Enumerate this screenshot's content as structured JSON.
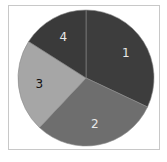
{
  "chart_data": {
    "type": "pie",
    "title": "",
    "categories": [
      "1",
      "2",
      "3",
      "4"
    ],
    "values": [
      32,
      30,
      22,
      16
    ],
    "colors": [
      "#3d3d3d",
      "#6e6e6e",
      "#a6a6a6",
      "#3a3a3a"
    ],
    "label_colors": [
      "#e8e8e8",
      "#e8e8e8",
      "#111111",
      "#e8e8e8"
    ],
    "start_angle": "12 o'clock",
    "direction": "clockwise",
    "legend": "none",
    "labels_on_slices": true
  },
  "slices": [
    {
      "label": "1"
    },
    {
      "label": "2"
    },
    {
      "label": "3"
    },
    {
      "label": "4"
    }
  ]
}
